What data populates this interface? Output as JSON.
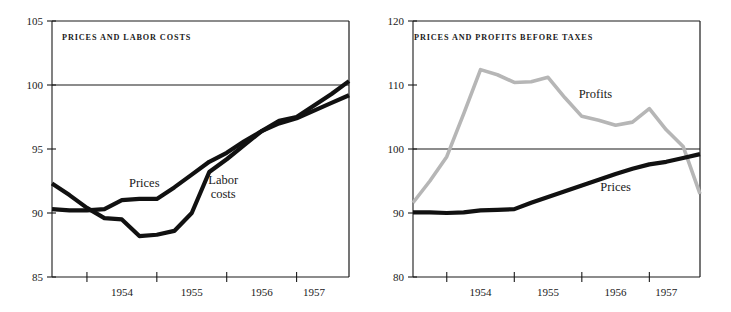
{
  "figure": {
    "panels": [
      "left",
      "right"
    ]
  },
  "chart_data": [
    {
      "type": "line",
      "title": "PRICES  AND  LABOR  COSTS",
      "xlabel": "",
      "ylabel": "",
      "ylim": [
        85,
        105
      ],
      "yticks": [
        85,
        90,
        95,
        100,
        105
      ],
      "ytick_labels": [
        "85",
        "90",
        "95",
        "100",
        "105"
      ],
      "xlim": [
        1953.5,
        1957.75
      ],
      "xticks": [
        1954.0,
        1955.0,
        1956.0,
        1957.0
      ],
      "xtick_labels": [
        "1954",
        "1955",
        "1956",
        "1957"
      ],
      "xtick_label_positions": [
        1954.5,
        1955.5,
        1956.5,
        1957.25
      ],
      "grid": false,
      "reference_line": 100,
      "series": [
        {
          "name": "Prices",
          "color": "#111111",
          "label_x": 1954.82,
          "label_y": 92.0,
          "x": [
            1953.5,
            1953.75,
            1954.0,
            1954.25,
            1954.5,
            1954.75,
            1955.0,
            1955.25,
            1955.5,
            1955.75,
            1956.0,
            1956.25,
            1956.5,
            1956.75,
            1957.0,
            1957.25,
            1957.5,
            1957.75
          ],
          "values": [
            90.3,
            90.2,
            90.2,
            90.3,
            91.0,
            91.1,
            91.1,
            92.0,
            93.0,
            94.0,
            94.7,
            95.6,
            96.4,
            97.0,
            97.4,
            98.0,
            98.6,
            99.2
          ]
        },
        {
          "name": "Labor costs",
          "color": "#111111",
          "label_x": 1955.95,
          "label_y": 92.3,
          "label_line2": "costs",
          "x": [
            1953.5,
            1953.75,
            1954.0,
            1954.25,
            1954.5,
            1954.75,
            1955.0,
            1955.25,
            1955.5,
            1955.75,
            1956.0,
            1956.25,
            1956.5,
            1956.75,
            1957.0,
            1957.25,
            1957.5,
            1957.75
          ],
          "values": [
            92.3,
            91.4,
            90.4,
            89.6,
            89.5,
            88.2,
            88.3,
            88.6,
            90.0,
            93.2,
            94.2,
            95.3,
            96.4,
            97.2,
            97.5,
            98.4,
            99.3,
            100.3
          ]
        }
      ]
    },
    {
      "type": "line",
      "title": "PRICES   AND  PROFITS  BEFORE  TAXES",
      "xlabel": "",
      "ylabel": "",
      "ylim": [
        80,
        120
      ],
      "yticks": [
        80,
        90,
        100,
        110,
        120
      ],
      "ytick_labels": [
        "80",
        "90",
        "100",
        "110",
        "120"
      ],
      "xlim": [
        1953.5,
        1957.75
      ],
      "xticks": [
        1954.0,
        1955.0,
        1956.0,
        1957.0
      ],
      "xtick_labels": [
        "1954",
        "1955",
        "1956",
        "1957"
      ],
      "xtick_label_positions": [
        1954.5,
        1955.5,
        1956.5,
        1957.25
      ],
      "grid": false,
      "reference_line": 100,
      "series": [
        {
          "name": "Profits",
          "color": "#b6b6b6",
          "label_x": 1956.2,
          "label_y": 108.0,
          "x": [
            1953.5,
            1953.75,
            1954.0,
            1954.25,
            1954.5,
            1954.75,
            1955.0,
            1955.25,
            1955.5,
            1955.75,
            1956.0,
            1956.25,
            1956.5,
            1956.75,
            1957.0,
            1957.25,
            1957.5,
            1957.75
          ],
          "values": [
            91.6,
            95.0,
            98.8,
            105.5,
            112.4,
            111.6,
            110.4,
            110.5,
            111.2,
            108.0,
            105.1,
            104.5,
            103.7,
            104.2,
            106.3,
            103.0,
            100.4,
            93.0
          ]
        },
        {
          "name": "Prices",
          "color": "#111111",
          "label_x": 1956.5,
          "label_y": 93.5,
          "x": [
            1953.5,
            1953.75,
            1954.0,
            1954.25,
            1954.5,
            1954.75,
            1955.0,
            1955.25,
            1955.5,
            1955.75,
            1956.0,
            1956.25,
            1956.5,
            1956.75,
            1957.0,
            1957.25,
            1957.5,
            1957.75
          ],
          "values": [
            90.1,
            90.1,
            90.0,
            90.1,
            90.4,
            90.5,
            90.6,
            91.6,
            92.5,
            93.4,
            94.3,
            95.2,
            96.1,
            96.9,
            97.6,
            98.0,
            98.6,
            99.2
          ]
        }
      ]
    }
  ]
}
